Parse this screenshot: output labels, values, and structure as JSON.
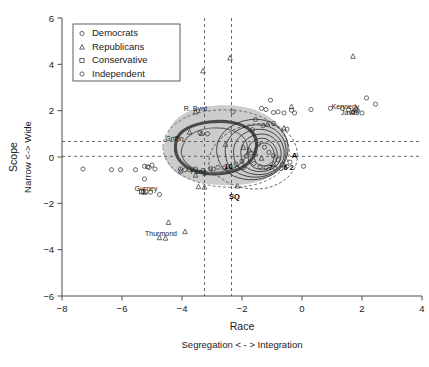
{
  "chart_data": {
    "type": "scatter",
    "title": "",
    "xlabel": "Race",
    "xsublabel": "Segregation < - > Integration",
    "ylabel": "Scope",
    "ysublabel": "Narrow <-> Wide",
    "xlim": [
      -8,
      4
    ],
    "ylim": [
      -6,
      6
    ],
    "xticks": [
      -8,
      -6,
      -4,
      -2,
      0,
      2,
      4
    ],
    "yticks": [
      -6,
      -4,
      -2,
      0,
      2,
      4,
      6
    ],
    "xticklabels": [
      "−8",
      "−6",
      "−4",
      "−2",
      "0",
      "2",
      "4"
    ],
    "yticklabels": [
      "−6",
      "−4",
      "−2",
      "0",
      "2",
      "4",
      "6"
    ],
    "grid": false,
    "legend_position": "top-left",
    "legend": [
      {
        "label": "Democrats",
        "marker": "circle"
      },
      {
        "label": "Republicans",
        "marker": "triangle"
      },
      {
        "label": "Conservative",
        "marker": "square"
      },
      {
        "label": "Independent",
        "marker": "circle"
      }
    ],
    "reference_lines": {
      "vertical": [
        -3.25,
        -2.35
      ],
      "horizontal": [
        0.67,
        0.03
      ]
    },
    "annotations": [
      {
        "text": "R. Byrd",
        "x": -3.55,
        "y": 1.97,
        "bold": false
      },
      {
        "text": "Griffin",
        "x": -4.25,
        "y": 0.68,
        "bold": false
      },
      {
        "text": "Fong",
        "x": -3.45,
        "y": -0.72,
        "bold": false
      },
      {
        "text": "Gurney",
        "x": -5.2,
        "y": -1.46,
        "bold": false
      },
      {
        "text": "Thurmond",
        "x": -4.7,
        "y": -3.43,
        "bold": false
      },
      {
        "text": "Kennedy",
        "x": 1.45,
        "y": 2.07,
        "bold": false
      },
      {
        "text": "Javits",
        "x": 1.6,
        "y": 1.83,
        "bold": false
      },
      {
        "text": "SQ",
        "x": -2.25,
        "y": -1.82,
        "bold": true
      },
      {
        "text": "A",
        "x": -0.25,
        "y": -0.06,
        "bold": true
      },
      {
        "text": "7",
        "x": -1.05,
        "y": -0.55,
        "bold": true
      },
      {
        "text": "6",
        "x": -0.55,
        "y": -0.58,
        "bold": true
      },
      {
        "text": "2",
        "x": -0.35,
        "y": -0.58,
        "bold": true
      },
      {
        "text": "10",
        "x": -2.45,
        "y": -0.52,
        "bold": true
      }
    ],
    "series": [
      {
        "name": "Democrats",
        "marker": "circle",
        "points": [
          [
            -7.3,
            -0.52
          ],
          [
            -6.35,
            -0.55
          ],
          [
            -6.05,
            -0.55
          ],
          [
            -5.55,
            -0.55
          ],
          [
            -5.25,
            -0.4
          ],
          [
            -5.1,
            -0.45
          ],
          [
            -5.0,
            -0.35
          ],
          [
            -4.9,
            -0.52
          ],
          [
            -5.25,
            -0.95
          ],
          [
            -4.75,
            -1.62
          ],
          [
            -5.2,
            -1.5
          ],
          [
            -5.05,
            -1.52
          ],
          [
            -4.05,
            -0.52
          ],
          [
            -3.9,
            -0.55
          ],
          [
            -3.75,
            -0.55
          ],
          [
            -3.55,
            -0.52
          ],
          [
            -3.3,
            -0.58
          ],
          [
            -3.05,
            -0.5
          ],
          [
            -2.95,
            -0.52
          ],
          [
            -2.45,
            -0.52
          ],
          [
            -3.4,
            1.05
          ],
          [
            -2.3,
            1.95
          ],
          [
            -1.55,
            1.62
          ],
          [
            -1.35,
            2.1
          ],
          [
            -1.2,
            2.05
          ],
          [
            -1.05,
            2.45
          ],
          [
            -0.95,
            1.92
          ],
          [
            -0.8,
            1.95
          ],
          [
            -0.6,
            1.9
          ],
          [
            -0.5,
            1.2
          ],
          [
            -0.35,
            2.02
          ],
          [
            -0.25,
            1.9
          ],
          [
            0.3,
            2.05
          ],
          [
            0.95,
            2.1
          ],
          [
            1.35,
            2.1
          ],
          [
            1.55,
            2.05
          ],
          [
            1.7,
            1.95
          ],
          [
            1.85,
            2.0
          ],
          [
            2.0,
            1.9
          ],
          [
            2.15,
            2.55
          ],
          [
            2.45,
            2.28
          ],
          [
            -1.45,
            0.55
          ],
          [
            -1.25,
            0.42
          ],
          [
            -1.1,
            0.2
          ],
          [
            -0.95,
            0.05
          ],
          [
            -0.8,
            -0.12
          ],
          [
            -0.65,
            -0.32
          ],
          [
            -0.5,
            -0.4
          ],
          [
            -0.4,
            -0.22
          ],
          [
            -1.7,
            0.18
          ],
          [
            -1.85,
            0.05
          ],
          [
            -2.0,
            -0.18
          ],
          [
            -2.2,
            -0.3
          ],
          [
            -1.6,
            -0.28
          ],
          [
            -1.4,
            -0.42
          ],
          [
            -1.2,
            -0.46
          ],
          [
            -0.9,
            -0.48
          ],
          [
            -0.7,
            -0.5
          ],
          [
            -1.95,
            -0.45
          ],
          [
            -2.15,
            -0.48
          ],
          [
            -2.6,
            -0.48
          ],
          [
            -2.8,
            -0.45
          ],
          [
            -3.15,
            1.0
          ],
          [
            -0.95,
            1.45
          ],
          [
            -1.3,
            1.35
          ],
          [
            -1.65,
            1.18
          ]
        ]
      },
      {
        "name": "Republicans",
        "marker": "triangle",
        "points": [
          [
            -3.3,
            3.72
          ],
          [
            -2.4,
            4.28
          ],
          [
            1.7,
            4.35
          ],
          [
            -3.75,
            1.08
          ],
          [
            -3.35,
            1.02
          ],
          [
            -3.55,
            1.95
          ],
          [
            -0.35,
            2.18
          ],
          [
            1.8,
            2.1
          ],
          [
            1.7,
            1.95
          ],
          [
            -3.55,
            -0.78
          ],
          [
            -3.45,
            -1.28
          ],
          [
            -3.25,
            -1.3
          ],
          [
            -4.45,
            -2.82
          ],
          [
            -3.9,
            -3.22
          ],
          [
            -4.75,
            -3.48
          ],
          [
            -4.55,
            -3.5
          ],
          [
            -2.15,
            -1.25
          ],
          [
            -1.95,
            0.42
          ],
          [
            -1.75,
            0.3
          ],
          [
            -1.55,
            0.15
          ],
          [
            -1.35,
            -0.05
          ],
          [
            -0.95,
            -0.3
          ],
          [
            -2.55,
            0.55
          ],
          [
            -0.6,
            1.25
          ],
          [
            -1.15,
            1.42
          ],
          [
            -4.05,
            -0.6
          ],
          [
            -5.25,
            -1.52
          ],
          [
            -5.3,
            -1.48
          ]
        ]
      },
      {
        "name": "Conservative",
        "marker": "square",
        "points": [
          [
            -5.35,
            -1.5
          ]
        ]
      },
      {
        "name": "Independent",
        "marker": "circle-open",
        "points": [
          [
            -5.15,
            -0.42
          ],
          [
            0.05,
            -0.4
          ]
        ]
      }
    ],
    "shaded_region": {
      "fill": "#c9c9c9",
      "description": "grey kernel density blob centered near (-2.8, 0.25)"
    },
    "contours": [
      {
        "name": "outer-dashed",
        "style": "dashed",
        "color": "#555555"
      },
      {
        "name": "heavy-left",
        "style": "solid-thick",
        "color": "#4a4a4a"
      },
      {
        "name": "nested-right",
        "style": "solid-thin",
        "color": "#222222"
      }
    ]
  }
}
